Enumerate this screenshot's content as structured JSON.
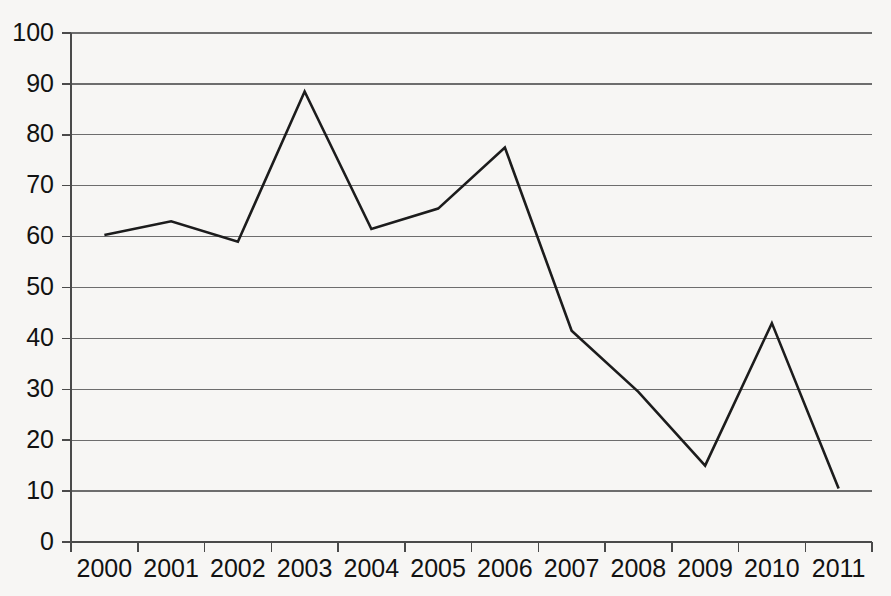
{
  "chart_data": {
    "type": "line",
    "title": "",
    "subtitle": "",
    "xlabel": "",
    "ylabel": "",
    "categories": [
      "2000",
      "2001",
      "2002",
      "2003",
      "2004",
      "2005",
      "2006",
      "2007",
      "2008",
      "2009",
      "2010",
      "2011"
    ],
    "values": [
      60.3,
      63.0,
      59.0,
      88.5,
      61.5,
      65.5,
      77.5,
      41.5,
      29.5,
      15.0,
      43.0,
      10.5
    ],
    "series": [
      {
        "name": "",
        "values": [
          60.3,
          63.0,
          59.0,
          88.5,
          61.5,
          65.5,
          77.5,
          41.5,
          29.5,
          15.0,
          43.0,
          10.5
        ],
        "color": "#1c1c1c"
      }
    ],
    "ylim": [
      0,
      100
    ],
    "ytick_labels": [
      "0",
      "10",
      "20",
      "30",
      "40",
      "50",
      "60",
      "70",
      "80",
      "90",
      "100"
    ],
    "ytick_values": [
      0,
      10,
      20,
      30,
      40,
      50,
      60,
      70,
      80,
      90,
      100
    ],
    "xtick_labels": [
      "2000",
      "2001",
      "2002",
      "2003",
      "2004",
      "2005",
      "2006",
      "2007",
      "2008",
      "2009",
      "2010",
      "2011"
    ],
    "grid": true,
    "grid_axis": "y",
    "legend": false,
    "legend_position": "none",
    "annotations": [],
    "colors": {
      "background": "#f7f6f4",
      "line": "#1c1c1c",
      "gridline": "#6d6d6d",
      "axis": "#4a4a4a",
      "text": "#121212"
    }
  }
}
